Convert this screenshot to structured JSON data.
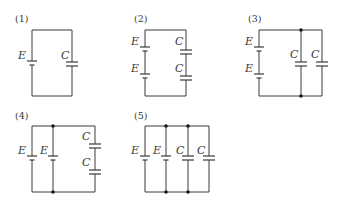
{
  "figure": {
    "circuits": [
      {
        "id": "1",
        "label": "(1)",
        "description": "Single battery E in series loop with single capacitor C",
        "components": [
          {
            "type": "battery",
            "label": "E"
          },
          {
            "type": "capacitor",
            "label": "C"
          }
        ]
      },
      {
        "id": "2",
        "label": "(2)",
        "description": "Two batteries E in series on left branch, two capacitors C in series on right branch",
        "components": [
          {
            "type": "battery",
            "label": "E"
          },
          {
            "type": "battery",
            "label": "E"
          },
          {
            "type": "capacitor",
            "label": "C"
          },
          {
            "type": "capacitor",
            "label": "C"
          }
        ]
      },
      {
        "id": "3",
        "label": "(3)",
        "description": "Two batteries E in series, two capacitors C in parallel",
        "components": [
          {
            "type": "battery",
            "label": "E"
          },
          {
            "type": "battery",
            "label": "E"
          },
          {
            "type": "capacitor",
            "label": "C"
          },
          {
            "type": "capacitor",
            "label": "C"
          }
        ]
      },
      {
        "id": "4",
        "label": "(4)",
        "description": "Two batteries E in parallel, two capacitors C in series",
        "components": [
          {
            "type": "battery",
            "label": "E"
          },
          {
            "type": "battery",
            "label": "E"
          },
          {
            "type": "capacitor",
            "label": "C"
          },
          {
            "type": "capacitor",
            "label": "C"
          }
        ]
      },
      {
        "id": "5",
        "label": "(5)",
        "description": "Two batteries E and two capacitors C all in parallel",
        "components": [
          {
            "type": "battery",
            "label": "E"
          },
          {
            "type": "battery",
            "label": "E"
          },
          {
            "type": "capacitor",
            "label": "C"
          },
          {
            "type": "capacitor",
            "label": "C"
          }
        ]
      }
    ],
    "colors": {
      "line": "#3a3a3a",
      "junction": "#1a1a1a",
      "background": "#ffffff"
    }
  }
}
